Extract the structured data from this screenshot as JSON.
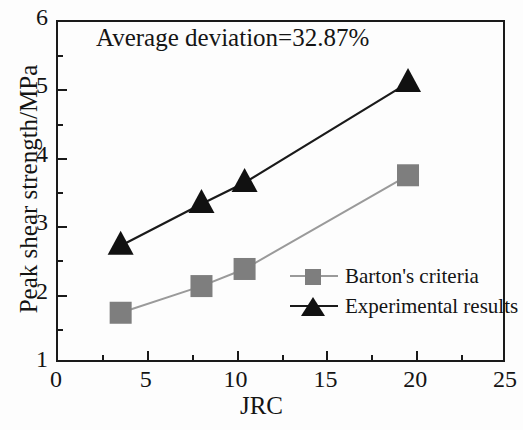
{
  "chart_data": {
    "type": "line",
    "title": "",
    "annotation": "Average deviation=32.87%",
    "xlabel": "JRC",
    "ylabel": "Peak shear strength/MPa",
    "xlim": [
      0,
      25
    ],
    "ylim": [
      1,
      6
    ],
    "grid": false,
    "legend_position": "center-right",
    "xticks": [
      0,
      5,
      10,
      15,
      20,
      25
    ],
    "xtick_labels": [
      "0",
      "5",
      "10",
      "15",
      "20",
      "25"
    ],
    "xticks_minor": [
      2.5,
      7.5,
      12.5,
      17.5,
      22.5
    ],
    "yticks": [
      1,
      2,
      3,
      4,
      5,
      6
    ],
    "ytick_labels": [
      "1",
      "2",
      "3",
      "4",
      "5",
      "6"
    ],
    "yticks_minor": [
      1.5,
      2.5,
      3.5,
      4.5,
      5.5
    ],
    "series": [
      {
        "name": "Barton's criteria",
        "marker": "square",
        "color": "#7e7e7e",
        "line_color": "#9a9a9a",
        "x": [
          3.6,
          8.1,
          10.5,
          19.6
        ],
        "y": [
          1.72,
          2.11,
          2.36,
          3.73
        ]
      },
      {
        "name": "Experimental results",
        "marker": "triangle",
        "color": "#111111",
        "line_color": "#1a1a1a",
        "x": [
          3.6,
          8.1,
          10.5,
          19.6
        ],
        "y": [
          2.7,
          3.31,
          3.62,
          5.08
        ]
      }
    ]
  },
  "legend": {
    "items": [
      {
        "label": "Barton's criteria"
      },
      {
        "label": "Experimental results"
      }
    ]
  }
}
